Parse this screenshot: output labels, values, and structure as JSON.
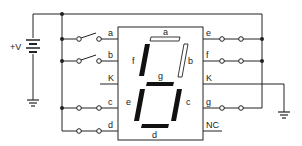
{
  "diagram": {
    "type": "circuit",
    "supply_label": "+V",
    "display": {
      "segments_lit": [
        "c",
        "d",
        "e",
        "f",
        "g"
      ],
      "segments_off": [
        "a",
        "b"
      ],
      "segment_labels": {
        "a": "a",
        "b": "b",
        "c": "c",
        "d": "d",
        "e": "e",
        "f": "f",
        "g": "g"
      }
    },
    "left_pins": [
      {
        "label": "a",
        "switch": "open"
      },
      {
        "label": "b",
        "switch": "open"
      },
      {
        "label": "K",
        "switch": "none"
      },
      {
        "label": "c",
        "switch": "closed"
      },
      {
        "label": "d",
        "switch": "closed"
      }
    ],
    "right_pins": [
      {
        "label": "e",
        "switch": "closed"
      },
      {
        "label": "f",
        "switch": "closed"
      },
      {
        "label": "K",
        "switch": "none"
      },
      {
        "label": "g",
        "switch": "closed"
      },
      {
        "label": "NC",
        "switch": "none"
      }
    ],
    "colors": {
      "line": "#222222",
      "background": "#ffffff"
    }
  }
}
